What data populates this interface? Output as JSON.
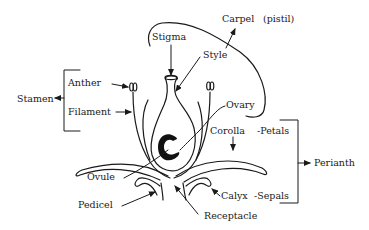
{
  "diagram": {
    "labels": {
      "stamen": "Stamen",
      "anther": "Anther",
      "filament": "Filament",
      "stigma": "Stigma",
      "style": "Style",
      "carpel": "Carpel",
      "pistil": "(pistil)",
      "ovary": "Ovary",
      "corolla": "Corolla",
      "petals": "-Petals",
      "perianth": "Perianth",
      "calyx": "Calyx",
      "sepals": "-Sepals",
      "ovule": "Ovule",
      "pedicel": "Pedicel",
      "receptacle": "Receptacle"
    },
    "groups": [
      {
        "name": "Stamen",
        "members": [
          "Anther",
          "Filament"
        ]
      },
      {
        "name": "Carpel (pistil)",
        "members": [
          "Stigma",
          "Style",
          "Ovary"
        ]
      },
      {
        "name": "Perianth",
        "members": [
          "Corolla -Petals",
          "Calyx -Sepals"
        ]
      }
    ],
    "colors": {
      "ink": "#1a1a1a",
      "background": "#ffffff"
    }
  }
}
